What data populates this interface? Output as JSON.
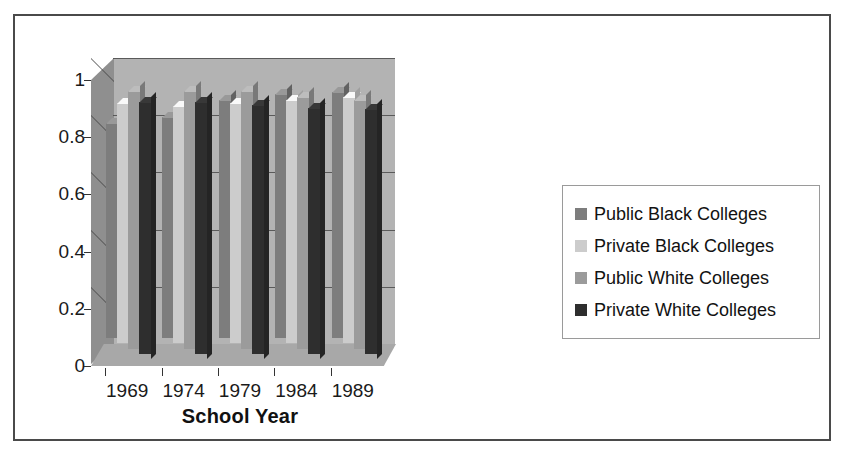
{
  "chart_data": {
    "type": "bar",
    "title": "",
    "xlabel": "School Year",
    "ylabel": "",
    "categories": [
      "1969",
      "1974",
      "1979",
      "1984",
      "1989"
    ],
    "ylim": [
      0,
      1
    ],
    "yticks": [
      "0",
      "0.2",
      "0.4",
      "0.6",
      "0.8",
      "1"
    ],
    "ytick_values": [
      0,
      0.2,
      0.4,
      0.6,
      0.8,
      1
    ],
    "grid": true,
    "legend_position": "right",
    "three_d": true,
    "series": [
      {
        "name": "Public Black Colleges",
        "color": "#7d7d7d",
        "values": [
          0.75,
          0.77,
          0.83,
          0.85,
          0.86
        ]
      },
      {
        "name": "Private Black Colleges",
        "color": "#cccccc",
        "values": [
          0.84,
          0.83,
          0.84,
          0.85,
          0.86
        ]
      },
      {
        "name": "Public White Colleges",
        "color": "#9b9b9b",
        "values": [
          0.9,
          0.9,
          0.9,
          0.88,
          0.87
        ]
      },
      {
        "name": "Private White Colleges",
        "color": "#2e2e2e",
        "values": [
          0.88,
          0.88,
          0.87,
          0.86,
          0.855
        ]
      }
    ]
  },
  "axis": {
    "x_title": "School Year"
  },
  "legend": {
    "items": [
      {
        "label": "Public Black Colleges",
        "color": "#7d7d7d"
      },
      {
        "label": "Private Black Colleges",
        "color": "#cccccc"
      },
      {
        "label": "Public White Colleges",
        "color": "#9b9b9b"
      },
      {
        "label": "Private White Colleges",
        "color": "#2e2e2e"
      }
    ]
  },
  "colors": {
    "frame_border": "#4a4a4a",
    "plot_back_wall": "#b3b3b3",
    "plot_left_wall": "#8f8f8f",
    "plot_floor": "#a8a8a8",
    "gridline": "#4a4a4a",
    "text": "#1a1a1a",
    "page_background": "#ffffff"
  }
}
